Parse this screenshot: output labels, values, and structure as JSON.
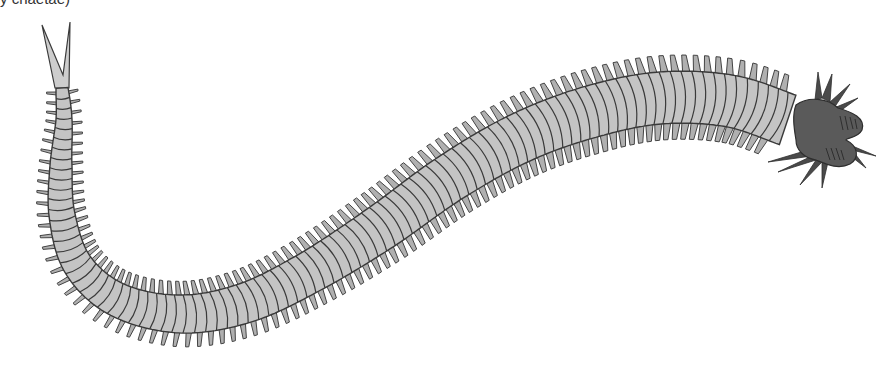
{
  "caption": {
    "text": "y chaetae)"
  },
  "illustration": {
    "subject": "polychaete bristle worm",
    "parts": [
      "tail-fork",
      "segmented-body",
      "parapodia",
      "head",
      "head-tentacles",
      "head-palps"
    ],
    "colors": {
      "body_fill": "#c4c4c4",
      "body_stroke": "#3a3a3a",
      "head_fill": "#5a5a5a",
      "head_stroke": "#2e2e2e",
      "parapodia_fill": "#b0b0b0",
      "tail_fill": "#cdcdcd"
    },
    "centerline": [
      [
        62,
        88
      ],
      [
        64,
        120
      ],
      [
        61,
        165
      ],
      [
        62,
        215
      ],
      [
        78,
        265
      ],
      [
        118,
        300
      ],
      [
        180,
        314
      ],
      [
        245,
        303
      ],
      [
        310,
        272
      ],
      [
        380,
        228
      ],
      [
        450,
        178
      ],
      [
        520,
        138
      ],
      [
        590,
        112
      ],
      [
        660,
        98
      ],
      [
        730,
        101
      ],
      [
        788,
        120
      ]
    ],
    "halfwidths": [
      6,
      8,
      11,
      13,
      15,
      17,
      19,
      20,
      21,
      23,
      24,
      25,
      26,
      26,
      26,
      26
    ],
    "segment_count": 96
  }
}
